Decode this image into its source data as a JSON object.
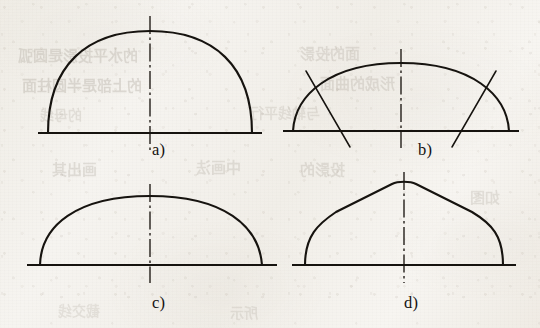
{
  "document": {
    "kind": "scanned-textbook-figure",
    "description": "Four arch / vault profile types drawn as line diagrams with dash-dot vertical centre lines",
    "background_color": "#f4f2ed",
    "ink_color": "#16130f",
    "centerline_color": "#2a2520"
  },
  "ghost_text": [
    {
      "text": "的水平投影是圆弧",
      "x": 18,
      "y": 44,
      "size": 15,
      "opacity": 0.17
    },
    {
      "text": "面的投影",
      "x": 300,
      "y": 42,
      "size": 15,
      "opacity": 0.15
    },
    {
      "text": "的上部是半圆柱面",
      "x": 22,
      "y": 74,
      "size": 15,
      "opacity": 0.18
    },
    {
      "text": "形成的曲面",
      "x": 320,
      "y": 72,
      "size": 15,
      "opacity": 0.15
    },
    {
      "text": "的母线",
      "x": 40,
      "y": 104,
      "size": 14,
      "opacity": 0.13
    },
    {
      "text": "与轴线平行",
      "x": 250,
      "y": 102,
      "size": 14,
      "opacity": 0.13
    },
    {
      "text": "画出其",
      "x": 52,
      "y": 158,
      "size": 15,
      "opacity": 0.16
    },
    {
      "text": "中画法",
      "x": 196,
      "y": 156,
      "size": 15,
      "opacity": 0.15
    },
    {
      "text": "投影的",
      "x": 300,
      "y": 158,
      "size": 15,
      "opacity": 0.15
    },
    {
      "text": "如图",
      "x": 470,
      "y": 186,
      "size": 15,
      "opacity": 0.14
    },
    {
      "text": "截交线",
      "x": 58,
      "y": 300,
      "size": 14,
      "opacity": 0.12
    },
    {
      "text": "所示",
      "x": 230,
      "y": 302,
      "size": 14,
      "opacity": 0.12
    }
  ],
  "figures": [
    {
      "id": "a",
      "label": "a)",
      "name": "semicircular-arch",
      "label_x": 152,
      "label_y": 140,
      "origin_x": 0,
      "origin_y": 0,
      "baseline": {
        "x1": 38,
        "y1": 133,
        "x2": 262,
        "y2": 133
      },
      "arch_path": "M 48 133 C 48 66, 86 31, 150 31 C 214 31, 252 66, 252 133",
      "centerline": {
        "x": 150,
        "y_top": 16,
        "y_bottom": 150
      },
      "obliques": []
    },
    {
      "id": "b",
      "label": "b)",
      "name": "flat-arch-with-radial-construction-lines",
      "label_x": 418,
      "label_y": 140,
      "origin_x": 0,
      "origin_y": 0,
      "baseline": {
        "x1": 283,
        "y1": 131,
        "x2": 519,
        "y2": 131
      },
      "arch_path": "M 293 131 C 295 95, 330 63, 401 63 C 472 63, 507 95, 509 131",
      "centerline": {
        "x": 401,
        "y_top": 49,
        "y_bottom": 148
      },
      "obliques": [
        {
          "x1": 306,
          "y1": 71,
          "x2": 350,
          "y2": 147
        },
        {
          "x1": 496,
          "y1": 71,
          "x2": 452,
          "y2": 147
        }
      ]
    },
    {
      "id": "c",
      "label": "c)",
      "name": "segmental-arch",
      "label_x": 152,
      "label_y": 293,
      "origin_x": 0,
      "origin_y": 0,
      "baseline": {
        "x1": 27,
        "y1": 265,
        "x2": 277,
        "y2": 265
      },
      "arch_path": "M 40 265 C 41 226, 76 196, 150 196 C 224 196, 259 226, 262 265",
      "centerline": {
        "x": 150,
        "y_top": 184,
        "y_bottom": 283
      },
      "obliques": []
    },
    {
      "id": "d",
      "label": "d)",
      "name": "pointed-peaked-arch",
      "label_x": 404,
      "label_y": 293,
      "origin_x": 0,
      "origin_y": 0,
      "baseline": {
        "x1": 292,
        "y1": 265,
        "x2": 516,
        "y2": 265
      },
      "arch_path": "M 305 265 C 305 236, 318 224, 336 212 L 392 184 C 398 181, 410 181, 416 184 L 472 212 C 492 224, 503 236, 503 265",
      "centerline": {
        "x": 404,
        "y_top": 172,
        "y_bottom": 283
      },
      "obliques": []
    }
  ],
  "centerline_dash_pattern": "18 3.5 2.5 3.5"
}
